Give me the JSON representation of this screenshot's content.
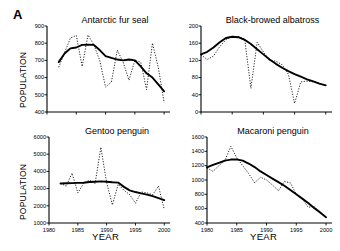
{
  "figure": {
    "panel_label": "A",
    "y_axis_label": "POPULATION",
    "x_axis_label": "YEAR"
  },
  "chart_data": [
    {
      "type": "line",
      "title": "Antarctic fur seal",
      "xlabel": "",
      "ylabel": "POPULATION",
      "xlim": [
        1980,
        2001
      ],
      "ylim": [
        400,
        900
      ],
      "yticks": [
        400,
        500,
        600,
        700,
        800,
        900
      ],
      "xticks": [
        1980,
        1985,
        1990,
        1995,
        2000
      ],
      "xtick_labels_visible": false,
      "grid": false,
      "legend": "none",
      "x": [
        1982,
        1983,
        1984,
        1985,
        1986,
        1987,
        1988,
        1989,
        1990,
        1991,
        1992,
        1993,
        1994,
        1995,
        1996,
        1997,
        1998,
        1999,
        2000
      ],
      "series": [
        {
          "name": "observed",
          "style": "dotted",
          "values": [
            660,
            745,
            830,
            845,
            665,
            848,
            790,
            700,
            545,
            575,
            760,
            690,
            585,
            700,
            690,
            530,
            800,
            660,
            455
          ]
        },
        {
          "name": "smoothed trend",
          "style": "solid",
          "values": [
            690,
            740,
            770,
            775,
            790,
            792,
            790,
            760,
            725,
            715,
            705,
            700,
            705,
            700,
            665,
            625,
            600,
            560,
            520
          ]
        }
      ]
    },
    {
      "type": "line",
      "title": "Black-browed albatross",
      "xlabel": "",
      "ylabel": "POPULATION",
      "xlim": [
        1980,
        2001
      ],
      "ylim": [
        0,
        200
      ],
      "yticks": [
        0,
        40,
        80,
        120,
        160,
        200
      ],
      "xticks": [
        1980,
        1985,
        1990,
        1995,
        2000
      ],
      "xtick_labels_visible": false,
      "grid": false,
      "legend": "none",
      "x": [
        1980,
        1981,
        1982,
        1983,
        1984,
        1985,
        1986,
        1987,
        1988,
        1989,
        1990,
        1991,
        1992,
        1993,
        1994,
        1995,
        1996,
        1997,
        1998,
        1999,
        2000
      ],
      "series": [
        {
          "name": "observed",
          "style": "dotted",
          "values": [
            133,
            122,
            130,
            152,
            168,
            176,
            175,
            170,
            55,
            162,
            140,
            120,
            118,
            110,
            88,
            20,
            70,
            72,
            70,
            65,
            62
          ]
        },
        {
          "name": "smoothed trend",
          "style": "solid",
          "values": [
            134,
            140,
            150,
            162,
            172,
            175,
            174,
            168,
            158,
            146,
            134,
            122,
            112,
            103,
            95,
            88,
            82,
            76,
            71,
            66,
            62
          ]
        }
      ]
    },
    {
      "type": "line",
      "title": "Gentoo penguin",
      "xlabel": "YEAR",
      "ylabel": "POPULATION",
      "xlim": [
        1980,
        2001
      ],
      "ylim": [
        1000,
        6000
      ],
      "yticks": [
        1000,
        2000,
        3000,
        4000,
        5000,
        6000
      ],
      "xticks": [
        1980,
        1985,
        1990,
        1995,
        2000
      ],
      "xtick_labels_visible": true,
      "grid": false,
      "legend": "none",
      "x": [
        1982,
        1983,
        1984,
        1985,
        1986,
        1987,
        1988,
        1989,
        1990,
        1991,
        1992,
        1993,
        1994,
        1995,
        1996,
        1997,
        1998,
        1999,
        2000
      ],
      "series": [
        {
          "name": "observed",
          "style": "dotted",
          "values": [
            3300,
            3150,
            3900,
            2750,
            3300,
            3500,
            3300,
            5400,
            3350,
            2050,
            3250,
            2900,
            2650,
            2150,
            2800,
            2750,
            2650,
            3150,
            1800
          ]
        },
        {
          "name": "smoothed trend",
          "style": "solid",
          "values": [
            3300,
            3310,
            3320,
            3330,
            3340,
            3380,
            3400,
            3420,
            3400,
            3370,
            3350,
            3100,
            2900,
            2800,
            2720,
            2650,
            2560,
            2450,
            2330
          ]
        }
      ]
    },
    {
      "type": "line",
      "title": "Macaroni penguin",
      "xlabel": "YEAR",
      "ylabel": "POPULATION",
      "xlim": [
        1980,
        2001
      ],
      "ylim": [
        400,
        1600
      ],
      "yticks": [
        400,
        600,
        800,
        1000,
        1200,
        1400,
        1600
      ],
      "xticks": [
        1980,
        1985,
        1990,
        1995,
        2000
      ],
      "xtick_labels_visible": true,
      "grid": false,
      "legend": "none",
      "x": [
        1980,
        1981,
        1982,
        1983,
        1984,
        1985,
        1986,
        1987,
        1988,
        1989,
        1990,
        1991,
        1992,
        1993,
        1994,
        1995,
        1996,
        1997,
        1998,
        1999,
        2000
      ],
      "series": [
        {
          "name": "observed",
          "style": "dotted",
          "values": [
            1170,
            1120,
            1200,
            1270,
            1470,
            1310,
            1200,
            1090,
            960,
            1040,
            1000,
            930,
            850,
            980,
            960,
            800,
            740,
            620,
            630,
            560,
            480
          ]
        },
        {
          "name": "smoothed trend",
          "style": "solid",
          "values": [
            1175,
            1210,
            1240,
            1270,
            1285,
            1288,
            1270,
            1230,
            1180,
            1120,
            1070,
            1020,
            970,
            920,
            860,
            800,
            740,
            680,
            610,
            545,
            480
          ]
        }
      ]
    }
  ]
}
